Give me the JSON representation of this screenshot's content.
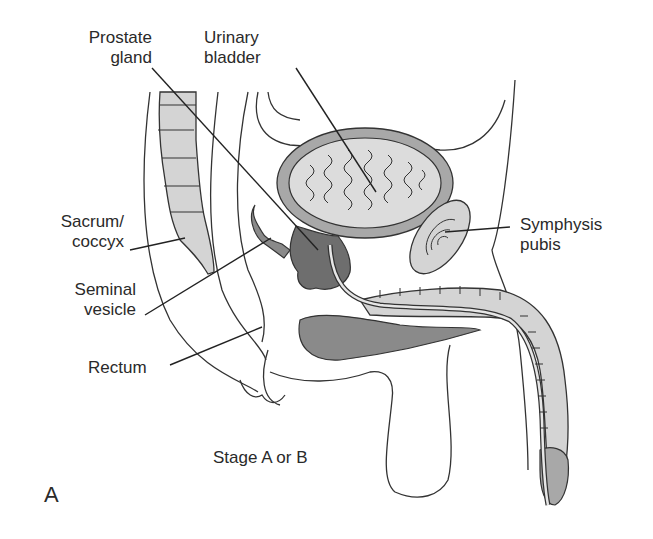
{
  "figure": {
    "panel_letter": "A",
    "caption": "Stage A or B",
    "colors": {
      "outline": "#333333",
      "light_fill": "#d4d4d4",
      "mid_fill": "#a8a8a8",
      "dark_fill": "#6e6e6e",
      "background": "#ffffff"
    },
    "labels": [
      {
        "id": "prostate-gland",
        "text": "Prostate\ngland"
      },
      {
        "id": "urinary-bladder",
        "text": "Urinary\nbladder"
      },
      {
        "id": "sacrum-coccyx",
        "text": "Sacrum/\ncoccyx"
      },
      {
        "id": "seminal-vesicle",
        "text": "Seminal\nvesicle"
      },
      {
        "id": "rectum",
        "text": "Rectum"
      },
      {
        "id": "symphysis-pubis",
        "text": "Symphysis\npubis"
      }
    ]
  }
}
